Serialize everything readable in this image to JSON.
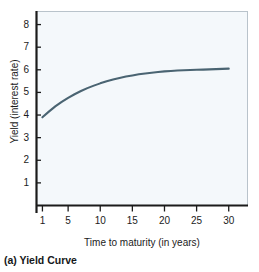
{
  "caption": "(a) Yield Curve",
  "colors": {
    "curve": "#4a6472",
    "axis": "#1b1b1b",
    "panel_background": "#f4f8fb",
    "panel_border": "#b9c3cb",
    "text": "#1b1b1b",
    "page_background": "#ffffff"
  },
  "chart_data": {
    "type": "line",
    "title": "",
    "subtitle": "",
    "xlabel": "Time to maturity (in years)",
    "ylabel": "Yield (interest rate)",
    "xlim": [
      0,
      33
    ],
    "ylim": [
      0,
      8.6
    ],
    "xticks": [
      1,
      5,
      10,
      15,
      20,
      25,
      30
    ],
    "xtick_labels": [
      "1",
      "5",
      "10",
      "15",
      "20",
      "25",
      "30"
    ],
    "yticks": [
      1,
      2,
      3,
      4,
      5,
      6,
      7,
      8
    ],
    "ytick_labels": [
      "1",
      "2",
      "3",
      "4",
      "5",
      "6",
      "7",
      "8"
    ],
    "grid": false,
    "legend": null,
    "annotations": [],
    "series": [
      {
        "name": "Yield curve",
        "color": "#4a6472",
        "x": [
          1,
          2,
          3,
          4,
          5,
          6,
          7,
          8,
          9,
          10,
          11,
          12,
          13,
          14,
          15,
          16,
          17,
          18,
          19,
          20,
          21,
          22,
          23,
          24,
          25,
          26,
          27,
          28,
          29,
          30
        ],
        "y": [
          3.9,
          4.15,
          4.38,
          4.58,
          4.76,
          4.92,
          5.06,
          5.19,
          5.3,
          5.4,
          5.49,
          5.57,
          5.64,
          5.7,
          5.75,
          5.8,
          5.84,
          5.87,
          5.9,
          5.93,
          5.95,
          5.97,
          5.98,
          5.99,
          6.0,
          6.01,
          6.02,
          6.03,
          6.04,
          6.05
        ]
      }
    ]
  }
}
